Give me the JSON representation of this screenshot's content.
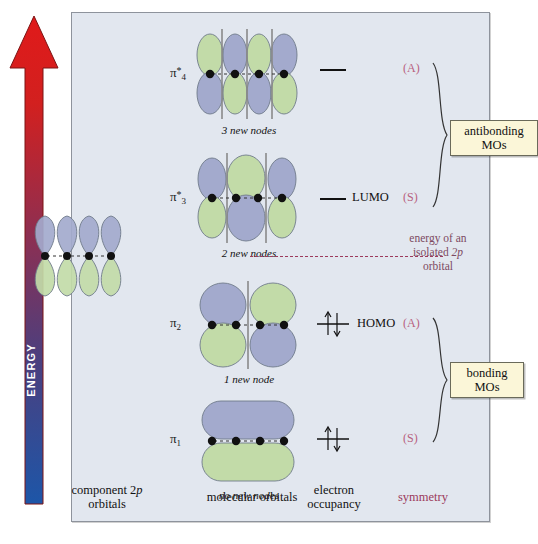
{
  "axis": {
    "label": "ENERGY",
    "direction": "up",
    "gradient_top": "#d62020",
    "gradient_bottom": "#2050a0"
  },
  "panel": {
    "background": "#e2e7ef",
    "lobe_blue": "#a3aacd",
    "lobe_green": "#c2dba8",
    "node_line": "#8a8a8a"
  },
  "column_headers": [
    {
      "name": "component-2p-orbitals",
      "line1": "component 2p",
      "line2": "orbitals"
    },
    {
      "name": "molecular-orbitals",
      "line1": "molecular orbitals",
      "line2": ""
    },
    {
      "name": "electron-occupancy",
      "line1": "electron",
      "line2": "occupancy"
    },
    {
      "name": "symmetry",
      "line1": "symmetry",
      "line2": "",
      "color": "#9c3a5c"
    }
  ],
  "orbitals": [
    {
      "id": "pi4",
      "label": "π",
      "sub": "4",
      "star": "*",
      "caption": "3 new nodes",
      "nodes": 3,
      "lobes": 4,
      "top_colors": [
        "green",
        "blue",
        "green",
        "blue"
      ],
      "occupancy": "empty",
      "level_label": "",
      "symmetry": "(A)"
    },
    {
      "id": "pi3",
      "label": "π",
      "sub": "3",
      "star": "*",
      "caption": "2 new nodes",
      "nodes": 2,
      "lobes": 3,
      "top_colors": [
        "blue",
        "green",
        "blue"
      ],
      "occupancy": "empty",
      "level_label": "LUMO",
      "symmetry": "(S)"
    },
    {
      "id": "pi2",
      "label": "π",
      "sub": "2",
      "star": "",
      "caption": "1 new node",
      "nodes": 1,
      "lobes": 2,
      "top_colors": [
        "blue",
        "green"
      ],
      "occupancy": "paired",
      "level_label": "HOMO",
      "symmetry": "(A)"
    },
    {
      "id": "pi1",
      "label": "π",
      "sub": "1",
      "star": "",
      "caption": "no new nodes",
      "nodes": 0,
      "lobes": 1,
      "top_colors": [
        "blue"
      ],
      "occupancy": "paired",
      "level_label": "",
      "symmetry": "(S)"
    }
  ],
  "annotations": {
    "antibonding": {
      "line1": "antibonding",
      "line2": "MOs"
    },
    "bonding": {
      "line1": "bonding",
      "line2": "MOs"
    },
    "isolated_2p": {
      "line1": "energy of an",
      "line2_a": "isolated ",
      "line2_b": "2p",
      "line3": "orbital"
    }
  }
}
